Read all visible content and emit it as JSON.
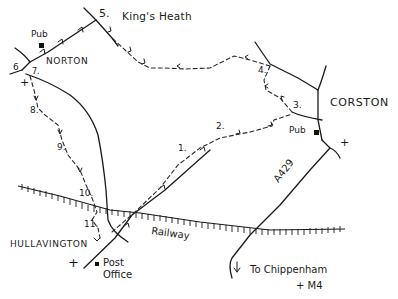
{
  "map": {
    "places": {
      "kings_heath": "King's Heath",
      "norton": "NORTON",
      "corston": "CORSTON",
      "hullavington": "HULLAVINGTON"
    },
    "features": {
      "pub_norton": "Pub",
      "pub_corston": "Pub",
      "post_office_line1": "Post",
      "post_office_line2": "Office",
      "railway": "Railway",
      "road_a429": "A429",
      "to_chippenham_line1": "To Chippenham",
      "to_chippenham_line2": "+ M4"
    },
    "symbols": {
      "church": "+"
    },
    "waypoints": [
      "1.",
      "2.",
      "3.",
      "4.",
      "5.",
      "6",
      "7.",
      "8.",
      "9.",
      "10.",
      "11."
    ],
    "colors": {
      "ink": "#1a1a1a",
      "background": "#ffffff"
    }
  }
}
